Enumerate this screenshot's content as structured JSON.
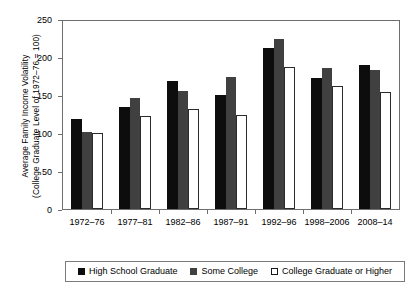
{
  "chart_data": {
    "type": "bar",
    "title": "",
    "subtitle": "",
    "xlabel": "",
    "ylabel_line1": "Average Family Income Volatility",
    "ylabel_line2": "(College Graduate Level of 1972–76 = 100)",
    "ylim": [
      0,
      250
    ],
    "yticks": [
      0,
      50,
      100,
      150,
      200,
      250
    ],
    "ytick_labels": [
      "0",
      "50",
      "100",
      "150",
      "200",
      "250"
    ],
    "grid": false,
    "legend_position": "bottom",
    "categories": [
      "1972–76",
      "1977–81",
      "1982–86",
      "1987–91",
      "1992–96",
      "1998–2006",
      "2008–14"
    ],
    "series": [
      {
        "name": "High School Graduate",
        "color": "#0d0d0d",
        "values": [
          120,
          136,
          170,
          151,
          214,
          174,
          192
        ]
      },
      {
        "name": "Some College",
        "color": "#404040",
        "values": [
          103,
          147,
          157,
          175,
          226,
          188,
          185
        ]
      },
      {
        "name": "College Graduate or Higher",
        "color": "#ffffff",
        "values": [
          101,
          124,
          133,
          125,
          189,
          163,
          155
        ]
      }
    ]
  },
  "colors": {
    "axis": "#6e6e6e",
    "text": "#000000",
    "background": "#ffffff",
    "series_high_school": "#0d0d0d",
    "series_some_college": "#404040",
    "series_college_grad": "#ffffff"
  }
}
